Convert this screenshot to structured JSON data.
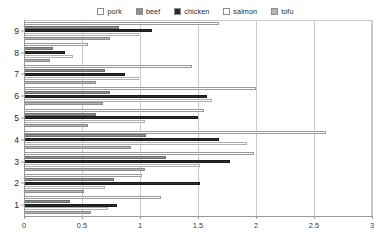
{
  "chart_data": {
    "type": "bar",
    "orientation": "horizontal",
    "title": "",
    "subtitle": "",
    "xlabel": "",
    "ylabel": "",
    "xlim": [
      0,
      3
    ],
    "ylim": [
      0,
      9
    ],
    "xticks": [
      "0",
      "0.5",
      "1",
      "1.5",
      "2",
      "2.5",
      "3"
    ],
    "xtick_values": [
      0,
      0.5,
      1,
      1.5,
      2,
      2.5,
      3
    ],
    "grid": true,
    "grid_axis": "x",
    "legend_position": "top",
    "categories": [
      "1",
      "2",
      "3",
      "4",
      "5",
      "6",
      "7",
      "8",
      "9"
    ],
    "series": [
      {
        "name": "pork",
        "color": "#ffffff",
        "values": [
          1.18,
          1.02,
          1.98,
          2.6,
          1.55,
          2.0,
          1.45,
          0.55,
          1.68
        ]
      },
      {
        "name": "beef",
        "color": "#8f8f8f",
        "values": [
          0.4,
          0.78,
          1.22,
          1.05,
          0.62,
          0.74,
          0.7,
          0.25,
          0.82
        ]
      },
      {
        "name": "chicken",
        "color": "#2a2a2a",
        "values": [
          0.8,
          1.52,
          1.78,
          1.68,
          1.5,
          1.58,
          0.87,
          0.35,
          1.1
        ]
      },
      {
        "name": "salmon",
        "color": "#ffffff",
        "values": [
          0.72,
          0.7,
          1.52,
          1.92,
          1.04,
          1.62,
          0.99,
          0.42,
          0.99
        ]
      },
      {
        "name": "tofu",
        "color": "#b5b5b5",
        "values": [
          0.58,
          0.52,
          1.04,
          0.92,
          0.55,
          0.68,
          0.62,
          0.22,
          0.74
        ]
      }
    ]
  },
  "legend": {
    "entries": [
      {
        "label": "pork",
        "swatch": "#ffffff"
      },
      {
        "label": "beef",
        "swatch": "#8f8f8f"
      },
      {
        "label": "chicken",
        "swatch": "#2a2a2a"
      },
      {
        "label": "salmon",
        "swatch": "#ffffff"
      },
      {
        "label": "tofu",
        "swatch": "#b5b5b5"
      }
    ]
  }
}
